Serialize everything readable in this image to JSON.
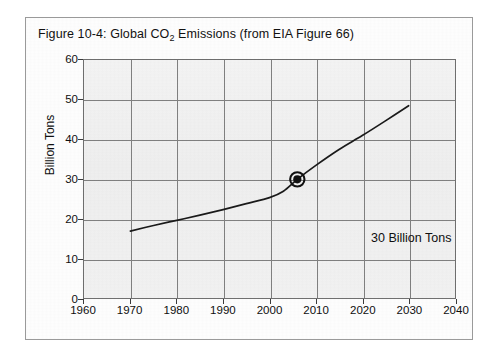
{
  "figure": {
    "title_prefix": "Figure 10-4:  Global CO",
    "title_subscript": "2",
    "title_suffix": " Emissions (from EIA Figure 66)",
    "title_full": "Figure 10-4:  Global CO2 Emissions (from EIA Figure 66)"
  },
  "annotation": {
    "marker_label": "30 Billion Tons"
  },
  "colors": {
    "frame_border": "#9a9a9a",
    "plot_border": "#6f6f6f",
    "grid": "#808080",
    "curve": "#1a1a1a",
    "plot_background": "#f3f3f3",
    "page_background": "#ffffff",
    "text": "#0f0f0f"
  },
  "chart_data": {
    "type": "line",
    "title": "Figure 10-4:  Global CO2 Emissions (from EIA Figure 66)",
    "xlabel": "",
    "ylabel": "Billion Tons",
    "xlim": [
      1960,
      2040
    ],
    "ylim": [
      0,
      60
    ],
    "xticks": [
      1960,
      1970,
      1980,
      1990,
      2000,
      2010,
      2020,
      2030,
      2040
    ],
    "xtick_labels": [
      "1960",
      "1970",
      "1980",
      "1990",
      "2000",
      "2010",
      "2020",
      "2030",
      "2040"
    ],
    "yticks": [
      0,
      10,
      20,
      30,
      40,
      50,
      60
    ],
    "ytick_labels": [
      "0",
      "10",
      "20",
      "30",
      "40",
      "50",
      "60"
    ],
    "grid": true,
    "legend": false,
    "series": [
      {
        "name": "Global CO2 Emissions",
        "x": [
          1970,
          1975,
          1980,
          1985,
          1990,
          1995,
          2000,
          2003,
          2006,
          2010,
          2015,
          2020,
          2025,
          2030
        ],
        "values": [
          17.0,
          18.4,
          19.7,
          21.0,
          22.4,
          23.9,
          25.4,
          27.0,
          30.0,
          33.5,
          37.5,
          41.0,
          44.7,
          48.5
        ]
      }
    ],
    "annotations": [
      {
        "text": "30 Billion Tons",
        "marker_x": 2006,
        "marker_y": 30,
        "marker_style": "filled-dot-with-open-circle"
      }
    ]
  }
}
